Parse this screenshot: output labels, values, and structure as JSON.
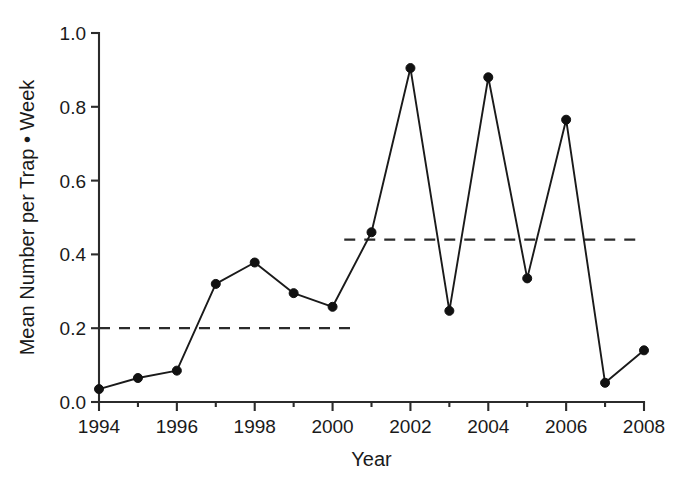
{
  "chart_data": {
    "type": "line",
    "title": "",
    "xlabel": "Year",
    "ylabel": "Mean Number per Trap • Week",
    "xlim": [
      1994,
      2008
    ],
    "ylim": [
      0.0,
      1.0
    ],
    "grid": false,
    "legend_position": "none",
    "x_tick_labels": [
      "1994",
      "1996",
      "1998",
      "2000",
      "2002",
      "2004",
      "2006",
      "2008"
    ],
    "x_tick_values": [
      1994,
      1996,
      1998,
      2000,
      2002,
      2004,
      2006,
      2008
    ],
    "x_minor_tick_values": [
      1995,
      1997,
      1999,
      2001,
      2003,
      2005,
      2007
    ],
    "y_tick_labels": [
      "0.0",
      "0.2",
      "0.4",
      "0.6",
      "0.8",
      "1.0"
    ],
    "y_tick_values": [
      0.0,
      0.2,
      0.4,
      0.6,
      0.8,
      1.0
    ],
    "marker": "filled-circle",
    "marker_size": 9,
    "line_color": "#1a1a1a",
    "marker_color": "#111111",
    "x": [
      1994,
      1995,
      1996,
      1997,
      1998,
      1999,
      2000,
      2001,
      2002,
      2003,
      2004,
      2005,
      2006,
      2007,
      2008
    ],
    "values": [
      0.035,
      0.065,
      0.085,
      0.32,
      0.378,
      0.295,
      0.258,
      0.46,
      0.905,
      0.247,
      0.88,
      0.335,
      0.765,
      0.052,
      0.14
    ],
    "series": [
      {
        "name": "Mean number per trap week",
        "x": [
          1994,
          1995,
          1996,
          1997,
          1998,
          1999,
          2000,
          2001,
          2002,
          2003,
          2004,
          2005,
          2006,
          2007,
          2008
        ],
        "values": [
          0.035,
          0.065,
          0.085,
          0.32,
          0.378,
          0.295,
          0.258,
          0.46,
          0.905,
          0.247,
          0.88,
          0.335,
          0.765,
          0.052,
          0.14
        ]
      }
    ],
    "annotations": [
      {
        "name": "mean-reference-line-early",
        "type": "horizontal-dashed-line",
        "y": 0.2,
        "x_start": 1994,
        "x_end": 2000.5,
        "color": "#2b2b2b"
      },
      {
        "name": "mean-reference-line-late",
        "type": "horizontal-dashed-line",
        "y": 0.44,
        "x_start": 2000.3,
        "x_end": 2008,
        "color": "#2b2b2b"
      }
    ]
  },
  "axes": {
    "x_axis_title": "Year",
    "y_axis_title": "Mean Number per Trap • Week"
  }
}
